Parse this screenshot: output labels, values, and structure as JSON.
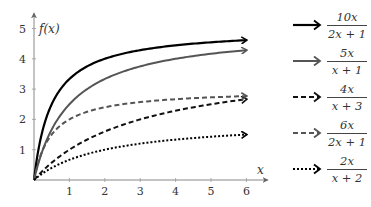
{
  "chart_data": {
    "type": "line",
    "title": "",
    "xlabel": "x",
    "ylabel": "f(x)",
    "xlim": [
      0,
      6
    ],
    "ylim": [
      0,
      5
    ],
    "xticks": [
      1,
      2,
      3,
      4,
      5,
      6
    ],
    "yticks": [
      1,
      2,
      3,
      4,
      5
    ],
    "grid": false,
    "legend_position": "right",
    "series": [
      {
        "name": "10x/(2x+1)",
        "numerator": "10x",
        "denominator": "2x + 1",
        "style": "solid",
        "color": "#000000",
        "width": 2.2,
        "x": [
          0,
          0.25,
          0.5,
          1,
          1.5,
          2,
          3,
          4,
          5,
          6
        ],
        "values": [
          0,
          1.67,
          2.5,
          3.33,
          3.75,
          4.0,
          4.29,
          4.44,
          4.55,
          4.62
        ]
      },
      {
        "name": "5x/(x+1)",
        "numerator": "5x",
        "denominator": "x + 1",
        "style": "solid",
        "color": "#555555",
        "width": 2.0,
        "x": [
          0,
          0.25,
          0.5,
          1,
          1.5,
          2,
          3,
          4,
          5,
          6
        ],
        "values": [
          0,
          1.0,
          1.67,
          2.5,
          3.0,
          3.33,
          3.75,
          4.0,
          4.17,
          4.29
        ]
      },
      {
        "name": "4x/(x+3)",
        "numerator": "4x",
        "denominator": "x + 3",
        "style": "dashed",
        "color": "#111111",
        "width": 2.0,
        "x": [
          0,
          0.25,
          0.5,
          1,
          1.5,
          2,
          3,
          4,
          5,
          6
        ],
        "values": [
          0,
          0.31,
          0.57,
          1.0,
          1.33,
          1.6,
          2.0,
          2.29,
          2.5,
          2.67
        ]
      },
      {
        "name": "6x/(2x+1)",
        "numerator": "6x",
        "denominator": "2x + 1",
        "style": "dashed",
        "color": "#555555",
        "width": 2.0,
        "x": [
          0,
          0.25,
          0.5,
          1,
          1.5,
          2,
          3,
          4,
          5,
          6
        ],
        "values": [
          0,
          1.0,
          1.5,
          2.0,
          2.25,
          2.4,
          2.57,
          2.67,
          2.73,
          2.77
        ]
      },
      {
        "name": "2x/(x+2)",
        "numerator": "2x",
        "denominator": "x + 2",
        "style": "dotted",
        "color": "#000000",
        "width": 2.0,
        "x": [
          0,
          0.25,
          0.5,
          1,
          1.5,
          2,
          3,
          4,
          5,
          6
        ],
        "values": [
          0,
          0.22,
          0.4,
          0.67,
          0.86,
          1.0,
          1.2,
          1.33,
          1.43,
          1.5
        ]
      }
    ]
  }
}
